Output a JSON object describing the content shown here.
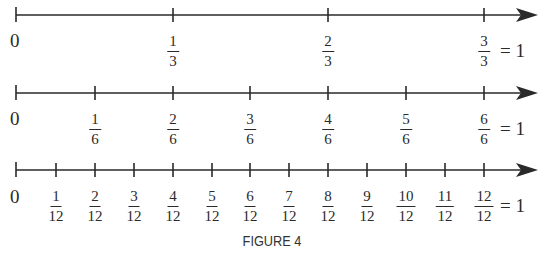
{
  "figure": {
    "caption": "FIGURE 4",
    "number_lines": [
      {
        "name": "thirds",
        "zero_label": "0",
        "ticks": [
          {
            "num": "1",
            "den": "3"
          },
          {
            "num": "2",
            "den": "3"
          },
          {
            "num": "3",
            "den": "3"
          }
        ],
        "equals_label": "= 1"
      },
      {
        "name": "sixths",
        "zero_label": "0",
        "ticks": [
          {
            "num": "1",
            "den": "6"
          },
          {
            "num": "2",
            "den": "6"
          },
          {
            "num": "3",
            "den": "6"
          },
          {
            "num": "4",
            "den": "6"
          },
          {
            "num": "5",
            "den": "6"
          },
          {
            "num": "6",
            "den": "6"
          }
        ],
        "equals_label": "= 1"
      },
      {
        "name": "twelfths",
        "zero_label": "0",
        "ticks": [
          {
            "num": "1",
            "den": "12"
          },
          {
            "num": "2",
            "den": "12"
          },
          {
            "num": "3",
            "den": "12"
          },
          {
            "num": "4",
            "den": "12"
          },
          {
            "num": "5",
            "den": "12"
          },
          {
            "num": "6",
            "den": "12"
          },
          {
            "num": "7",
            "den": "12"
          },
          {
            "num": "8",
            "den": "12"
          },
          {
            "num": "9",
            "den": "12"
          },
          {
            "num": "10",
            "den": "12"
          },
          {
            "num": "11",
            "den": "12"
          },
          {
            "num": "12",
            "den": "12"
          }
        ],
        "equals_label": "= 1"
      }
    ]
  }
}
